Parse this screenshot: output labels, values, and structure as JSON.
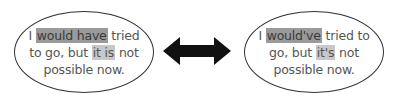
{
  "left_bubble": {
    "line1_pre": "I ",
    "line1_hl": "would have",
    "line1_post": " tried",
    "line2_pre": "to go, but ",
    "line2_hl": "it is",
    "line2_post": " not",
    "line3": "possible now."
  },
  "right_bubble": {
    "line1_pre": "I ",
    "line1_hl": "would've",
    "line1_post": " tried to",
    "line2_pre": "go, but ",
    "line2_hl": "it's",
    "line2_post": " not",
    "line3": "possible now."
  },
  "arrow": {
    "icon": "double-headed-arrow-icon",
    "color": "#111111"
  },
  "colors": {
    "highlight_dark": "#9a9a9a",
    "highlight_light": "#c8c8c8",
    "text": "#555555"
  }
}
